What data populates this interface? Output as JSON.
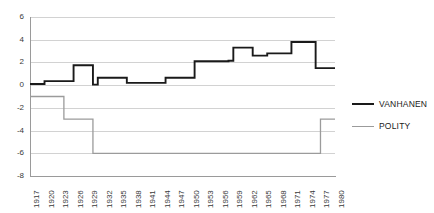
{
  "chart_data": {
    "type": "line",
    "title": "",
    "xlabel": "",
    "ylabel": "",
    "ylim": [
      -8,
      6
    ],
    "yticks": [
      6,
      4,
      2,
      0,
      -2,
      -4,
      -6,
      -8
    ],
    "grid": true,
    "legend_position": "right",
    "xlim": [
      1917,
      1980
    ],
    "x": [
      1917,
      1918,
      1919,
      1920,
      1921,
      1922,
      1923,
      1924,
      1925,
      1926,
      1927,
      1928,
      1929,
      1930,
      1931,
      1932,
      1933,
      1934,
      1935,
      1936,
      1937,
      1938,
      1939,
      1940,
      1941,
      1942,
      1943,
      1944,
      1945,
      1946,
      1947,
      1948,
      1949,
      1950,
      1951,
      1952,
      1953,
      1954,
      1955,
      1956,
      1957,
      1958,
      1959,
      1960,
      1961,
      1962,
      1963,
      1964,
      1965,
      1966,
      1967,
      1968,
      1969,
      1970,
      1971,
      1972,
      1973,
      1974,
      1975,
      1976,
      1977,
      1978,
      1979,
      1980
    ],
    "xtick_labels": [
      "1917",
      "1920",
      "1923",
      "1926",
      "1929",
      "1932",
      "1935",
      "1938",
      "1941",
      "1944",
      "1947",
      "1950",
      "1953",
      "1956",
      "1959",
      "1962",
      "1965",
      "1968",
      "1971",
      "1974",
      "1977",
      "1980"
    ],
    "series": [
      {
        "name": "VANHANEN",
        "color": "#1a1a1a",
        "values": [
          0.1,
          0.1,
          0.1,
          0.35,
          0.35,
          0.35,
          0.35,
          0.35,
          0.35,
          1.75,
          1.75,
          1.75,
          1.75,
          0.05,
          0.65,
          0.65,
          0.65,
          0.65,
          0.65,
          0.65,
          0.2,
          0.2,
          0.2,
          0.2,
          0.2,
          0.2,
          0.2,
          0.2,
          0.65,
          0.65,
          0.65,
          0.65,
          0.65,
          0.65,
          2.1,
          2.1,
          2.1,
          2.1,
          2.1,
          2.1,
          2.1,
          2.15,
          3.3,
          3.3,
          3.3,
          3.3,
          2.6,
          2.6,
          2.6,
          2.8,
          2.8,
          2.8,
          2.8,
          2.8,
          3.8,
          3.8,
          3.8,
          3.8,
          3.8,
          1.5,
          1.5,
          1.5,
          1.5,
          1.5
        ]
      },
      {
        "name": "POLITY",
        "color": "#9b9b9b",
        "values": [
          -1,
          -1,
          -1,
          -1,
          -1,
          -1,
          -1,
          -3,
          -3,
          -3,
          -3,
          -3,
          -3,
          -6,
          -6,
          -6,
          -6,
          -6,
          -6,
          -6,
          -6,
          -6,
          -6,
          -6,
          -6,
          -6,
          -6,
          -6,
          -6,
          -6,
          -6,
          -6,
          -6,
          -6,
          -6,
          -6,
          -6,
          -6,
          -6,
          -6,
          -6,
          -6,
          -6,
          -6,
          -6,
          -6,
          -6,
          -6,
          -6,
          -6,
          -6,
          -6,
          -6,
          -6,
          -6,
          -6,
          -6,
          -6,
          -6,
          -6,
          -3,
          -3,
          -3,
          -3
        ]
      }
    ]
  },
  "legend": {
    "items": [
      {
        "label": "VANHANEN"
      },
      {
        "label": "POLITY"
      }
    ]
  }
}
